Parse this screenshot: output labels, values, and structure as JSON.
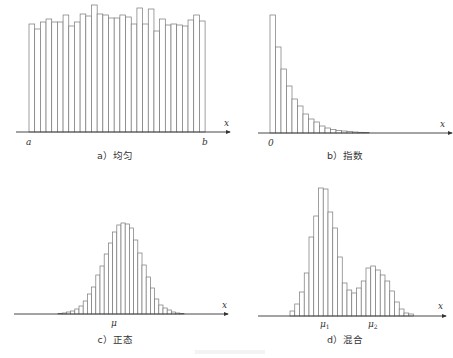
{
  "chart_data": [
    {
      "type": "bar",
      "title": "a）均匀",
      "xlabel": "x",
      "tick_labels": [
        "a",
        "b"
      ],
      "values": [
        24,
        29,
        22,
        19,
        22,
        22,
        15,
        26,
        22,
        14,
        16,
        5,
        14,
        15,
        18,
        18,
        15,
        17,
        24,
        8,
        24,
        9,
        31,
        19,
        25,
        24,
        25,
        26,
        20,
        15,
        21
      ],
      "value_space": "pixel_top_y",
      "baseline": 132,
      "x_start": 29,
      "bar_width": 5.68,
      "axis": {
        "x1": 16,
        "x2": 230,
        "y": 132
      },
      "ticks": [
        {
          "text": "a",
          "x": 26,
          "y": 145
        },
        {
          "text": "b",
          "x": 202,
          "y": 145
        }
      ],
      "caption": {
        "x": 115,
        "y": 159
      },
      "xlabel_pos": {
        "x": 224,
        "y": 126
      }
    },
    {
      "type": "bar",
      "title": "b）指数",
      "xlabel": "x",
      "tick_labels": [
        "0"
      ],
      "values": [
        15,
        47,
        69,
        86,
        99,
        106,
        114,
        119,
        122,
        126,
        128,
        129.5,
        130.5,
        131,
        131.5,
        132,
        132.3,
        132.6
      ],
      "value_space": "pixel_top_y",
      "baseline": 133,
      "x_start": 270,
      "bar_width": 5.5,
      "axis": {
        "x1": 258,
        "x2": 452,
        "y": 133
      },
      "ticks": [
        {
          "text": "0",
          "x": 268,
          "y": 146
        }
      ],
      "caption": {
        "x": 345,
        "y": 159
      },
      "xlabel_pos": {
        "x": 440,
        "y": 127
      }
    },
    {
      "type": "bar",
      "title": "c）正态",
      "xlabel": "x",
      "tick_labels": [
        "μ"
      ],
      "values": [
        313.5,
        313,
        312,
        311,
        309,
        306,
        301,
        294,
        287,
        275,
        266,
        254,
        243,
        232,
        225,
        223,
        224,
        228,
        240,
        253,
        265,
        277,
        288,
        299,
        305,
        308,
        310,
        312,
        313,
        313.5
      ],
      "value_space": "pixel_top_y",
      "baseline": 314,
      "x_start": 58,
      "bar_width": 4.2,
      "axis": {
        "x1": 14,
        "x2": 228,
        "y": 314
      },
      "ticks": [
        {
          "text": "μ",
          "x": 111,
          "y": 326
        }
      ],
      "caption": {
        "x": 115,
        "y": 343
      },
      "xlabel_pos": {
        "x": 222,
        "y": 308
      }
    },
    {
      "type": "bar",
      "title": "d）混合",
      "xlabel": "x",
      "tick_labels": [
        "μ1",
        "μ2"
      ],
      "values": [
        311,
        304,
        292,
        273,
        237,
        216,
        188,
        189,
        212,
        228,
        257,
        283,
        290,
        293,
        288,
        281,
        268,
        266,
        270,
        275,
        281,
        291,
        302,
        309,
        313,
        314
      ],
      "value_space": "pixel_top_y",
      "baseline": 316,
      "x_start": 290,
      "bar_width": 4.75,
      "axis": {
        "x1": 258,
        "x2": 446,
        "y": 316
      },
      "ticks": [
        {
          "text": "μ1",
          "x": 320,
          "y": 327
        },
        {
          "text": "μ2",
          "x": 368,
          "y": 327
        }
      ],
      "caption": {
        "x": 345,
        "y": 343
      },
      "xlabel_pos": {
        "x": 438,
        "y": 309
      }
    }
  ]
}
